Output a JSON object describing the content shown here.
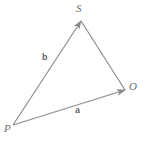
{
  "figure": {
    "background_color": "#ffffff",
    "line_color": "#8a8a8a",
    "label_color": "#6e6e6e",
    "vector_label_color": "#5f5f5f",
    "width": 145,
    "height": 143
  },
  "points": [
    {
      "name": "S",
      "label": "S",
      "x": 81,
      "y": 21,
      "role": "apex-vertex"
    },
    {
      "name": "O",
      "label": "O",
      "x": 125,
      "y": 90,
      "role": "right-vertex"
    },
    {
      "name": "P",
      "label": "P",
      "x": 13,
      "y": 125,
      "role": "origin-vertex"
    }
  ],
  "vectors": [
    {
      "name": "a",
      "label": "a",
      "from": "P",
      "to": "O",
      "arrowhead": "at-O",
      "label_x": 78,
      "label_y": 110
    },
    {
      "name": "b",
      "label": "b",
      "from": "P",
      "to": "S",
      "arrowhead": "at-S",
      "label_x": 45,
      "label_y": 57
    }
  ],
  "segments": [
    {
      "name": "SO",
      "from": "S",
      "to": "O",
      "arrowhead": "none"
    }
  ]
}
